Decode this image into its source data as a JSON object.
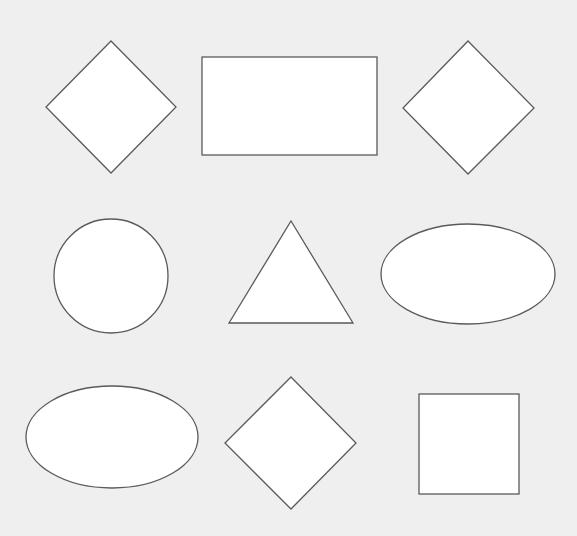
{
  "canvas": {
    "width": 577,
    "height": 536,
    "background": "#efefef"
  },
  "style": {
    "fill": "#ffffff",
    "stroke": "#5a5a5a"
  },
  "shapes": [
    {
      "id": "diamond-1",
      "type": "diamond",
      "row": 1,
      "col": 1,
      "points": [
        [
          111,
          41
        ],
        [
          176,
          107
        ],
        [
          111,
          173
        ],
        [
          46,
          107
        ]
      ]
    },
    {
      "id": "rectangle-1",
      "type": "rectangle",
      "row": 1,
      "col": 2,
      "x": 202,
      "y": 57,
      "width": 175,
      "height": 98
    },
    {
      "id": "diamond-2",
      "type": "diamond",
      "row": 1,
      "col": 3,
      "points": [
        [
          468,
          41
        ],
        [
          534,
          108
        ],
        [
          468,
          174
        ],
        [
          403,
          108
        ]
      ]
    },
    {
      "id": "circle-1",
      "type": "circle",
      "row": 2,
      "col": 1,
      "cx": 111,
      "cy": 276,
      "r": 57
    },
    {
      "id": "triangle-1",
      "type": "triangle",
      "row": 2,
      "col": 2,
      "points": [
        [
          291,
          221
        ],
        [
          353,
          323
        ],
        [
          229,
          323
        ]
      ]
    },
    {
      "id": "ellipse-1",
      "type": "ellipse",
      "row": 2,
      "col": 3,
      "cx": 468,
      "cy": 274,
      "rx": 87,
      "ry": 50
    },
    {
      "id": "ellipse-2",
      "type": "ellipse",
      "row": 3,
      "col": 1,
      "cx": 112,
      "cy": 437,
      "rx": 86,
      "ry": 51
    },
    {
      "id": "diamond-3",
      "type": "diamond",
      "row": 3,
      "col": 2,
      "points": [
        [
          291,
          377
        ],
        [
          356,
          443
        ],
        [
          291,
          509
        ],
        [
          225,
          443
        ]
      ]
    },
    {
      "id": "square-1",
      "type": "square",
      "row": 3,
      "col": 3,
      "x": 419,
      "y": 394,
      "width": 100,
      "height": 100
    }
  ]
}
